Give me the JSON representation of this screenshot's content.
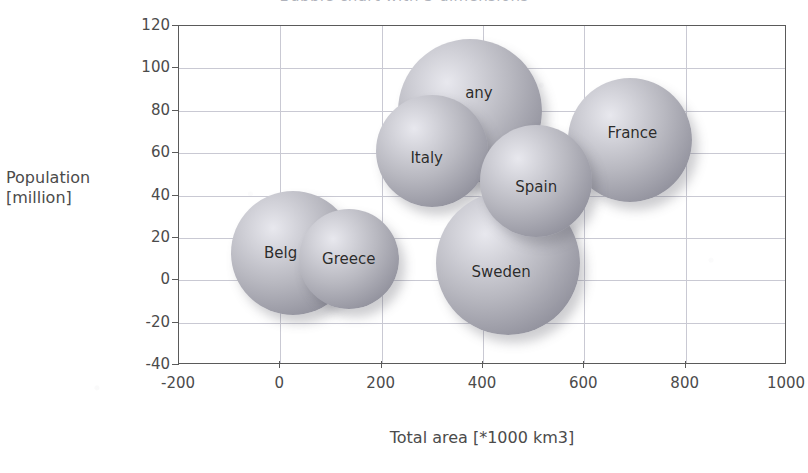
{
  "chart_data": {
    "type": "scatter",
    "subtype": "bubble",
    "title": "Bubble chart with 3 dimensions",
    "xlabel": "Total area [*1000 km3]",
    "ylabel_line1": "Population",
    "ylabel_line2": "[million]",
    "xlim": [
      -200,
      1000
    ],
    "ylim": [
      -40,
      120
    ],
    "xticks": [
      -200,
      0,
      200,
      400,
      600,
      800,
      1000
    ],
    "yticks": [
      -40,
      -20,
      0,
      20,
      40,
      60,
      80,
      100,
      120
    ],
    "grid": true,
    "legend": "none",
    "bubble_fill": "#b8b8c0",
    "points": [
      {
        "label": "Belg",
        "full_label": "Belgium",
        "x": 25,
        "y": 13,
        "r_px": 62,
        "z": 1,
        "clipped_label": true
      },
      {
        "label": "Greece",
        "full_label": "Greece",
        "x": 135,
        "y": 10,
        "r_px": 50,
        "z": 2,
        "clipped_label": false
      },
      {
        "label": "Italy",
        "full_label": "Italy",
        "x": 300,
        "y": 61,
        "r_px": 56,
        "z": 4,
        "clipped_label": false
      },
      {
        "label": "any",
        "full_label": "Germany",
        "x": 375,
        "y": 80,
        "r_px": 72,
        "z": 3,
        "clipped_label": true
      },
      {
        "label": "Sweden",
        "full_label": "Sweden",
        "x": 450,
        "y": 8,
        "r_px": 72,
        "z": 5,
        "clipped_label": false
      },
      {
        "label": "Spain",
        "full_label": "Spain",
        "x": 505,
        "y": 47,
        "r_px": 56,
        "z": 6,
        "clipped_label": false
      },
      {
        "label": "France",
        "full_label": "France",
        "x": 690,
        "y": 66,
        "r_px": 62,
        "z": 2,
        "clipped_label": false
      }
    ]
  },
  "colors": {
    "bubble": "#b8b8c0",
    "bubble_highlight": "#e8e8ee",
    "bubble_shadow": "#8a8a96",
    "grid": "#c9c9d3",
    "axis": "#5a5a5a",
    "text": "#4b4b4b",
    "background": "#ffffff"
  }
}
